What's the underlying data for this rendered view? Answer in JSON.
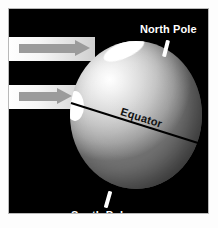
{
  "figure": {
    "background_color": "#000000",
    "page_color": "#ffffff"
  },
  "labels": {
    "north_pole": "North Pole",
    "south_pole": "South Pole",
    "equator": "Equator"
  },
  "colors": {
    "label_text": "#ffffff",
    "equator_text": "#111111",
    "equator_line": "#000000",
    "arrow": "#9b9b9b",
    "beam_light": "#ffffff",
    "planet_light": "#ffffff",
    "planet_dark": "#7b7b7b"
  },
  "beams": [
    {
      "name": "upper-sunlight-beam",
      "arrow_length": "long"
    },
    {
      "name": "lower-sunlight-beam",
      "arrow_length": "short"
    }
  ],
  "planet": {
    "name": "earth-sphere",
    "tilt_degrees": 17.5,
    "light_direction": "from-left",
    "highlight_position": "upper-left"
  }
}
